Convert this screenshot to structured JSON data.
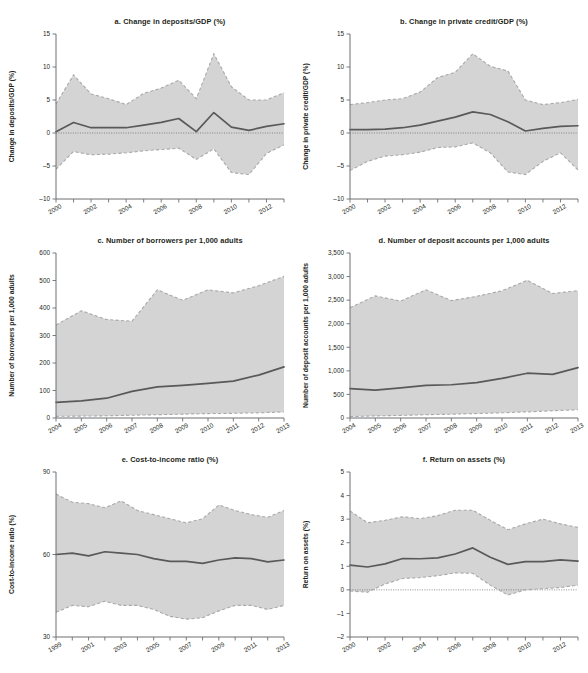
{
  "figure": {
    "panel_count": 6,
    "accent_band_color": "#d4d4d4",
    "line_color": "#58595b",
    "edge_color": "#a7a9ac",
    "axis_color": "#6d6e71"
  },
  "chart_data": [
    {
      "id": "a",
      "type": "line",
      "title": "a. Change in deposits/GDP (%)",
      "xlabel": "",
      "ylabel": "Change in deposits/GDP (%)",
      "xlim": [
        2000,
        2013
      ],
      "ylim": [
        -10,
        15
      ],
      "ytick_values": [
        -10,
        -5,
        0,
        5,
        10,
        15
      ],
      "ytick_labels": [
        "–10",
        "–5",
        "0",
        "5",
        "10",
        "15"
      ],
      "xtick_values": [
        2000,
        2001,
        2002,
        2003,
        2004,
        2005,
        2006,
        2007,
        2008,
        2009,
        2010,
        2011,
        2012,
        2013
      ],
      "xtick_labels": [
        "2000",
        "",
        "2002",
        "",
        "2004",
        "",
        "2006",
        "",
        "2008",
        "",
        "2010",
        "",
        "2012",
        ""
      ],
      "grid": false,
      "legend": "none",
      "zero_reference_line": 0,
      "x": [
        2000,
        2001,
        2002,
        2003,
        2004,
        2005,
        2006,
        2007,
        2008,
        2009,
        2010,
        2011,
        2012,
        2013
      ],
      "series": [
        {
          "name": "mean",
          "values": [
            0.2,
            1.6,
            0.8,
            0.8,
            0.8,
            1.2,
            1.6,
            2.2,
            0.2,
            3.1,
            0.9,
            0.4,
            1.0,
            1.4
          ]
        },
        {
          "name": "upper_bound",
          "values": [
            4.4,
            8.8,
            5.9,
            5.2,
            4.3,
            6.0,
            6.8,
            8.0,
            5.2,
            12.0,
            7.0,
            5.0,
            5.0,
            6.1
          ]
        },
        {
          "name": "lower_bound",
          "values": [
            -5.5,
            -2.8,
            -3.3,
            -3.2,
            -3.0,
            -2.7,
            -2.5,
            -2.3,
            -4.0,
            -2.4,
            -6.0,
            -6.3,
            -3.1,
            -1.8
          ]
        }
      ]
    },
    {
      "id": "b",
      "type": "line",
      "title": "b. Change in private credit/GDP (%)",
      "xlabel": "",
      "ylabel": "Change in private credit/GDP (%)",
      "xlim": [
        2000,
        2013
      ],
      "ylim": [
        -10,
        15
      ],
      "ytick_values": [
        -10,
        -5,
        0,
        5,
        10,
        15
      ],
      "ytick_labels": [
        "–10",
        "–5",
        "0",
        "5",
        "10",
        "15"
      ],
      "xtick_values": [
        2000,
        2001,
        2002,
        2003,
        2004,
        2005,
        2006,
        2007,
        2008,
        2009,
        2010,
        2011,
        2012,
        2013
      ],
      "xtick_labels": [
        "2000",
        "",
        "2002",
        "",
        "2004",
        "",
        "2006",
        "",
        "2008",
        "",
        "2010",
        "",
        "2012",
        ""
      ],
      "grid": false,
      "legend": "none",
      "zero_reference_line": 0,
      "x": [
        2000,
        2001,
        2002,
        2003,
        2004,
        2005,
        2006,
        2007,
        2008,
        2009,
        2010,
        2011,
        2012,
        2013
      ],
      "series": [
        {
          "name": "mean",
          "values": [
            0.5,
            0.5,
            0.6,
            0.8,
            1.2,
            1.8,
            2.4,
            3.2,
            2.8,
            1.7,
            0.3,
            0.7,
            1.0,
            1.1
          ]
        },
        {
          "name": "upper_bound",
          "values": [
            4.3,
            4.6,
            5.0,
            5.2,
            6.2,
            8.4,
            9.2,
            12.0,
            10.1,
            9.4,
            5.0,
            4.3,
            4.6,
            5.1
          ]
        },
        {
          "name": "lower_bound",
          "values": [
            -5.7,
            -4.3,
            -3.5,
            -3.3,
            -2.9,
            -2.2,
            -2.1,
            -1.5,
            -3.0,
            -5.9,
            -6.3,
            -4.3,
            -3.0,
            -5.6
          ]
        }
      ]
    },
    {
      "id": "c",
      "type": "line",
      "title": "c. Number of borrowers per 1,000 adults",
      "xlabel": "",
      "ylabel": "Number of borrowers per 1,000 adults",
      "xlim": [
        2004,
        2013
      ],
      "ylim": [
        0,
        600
      ],
      "ytick_values": [
        0,
        100,
        200,
        300,
        400,
        500,
        600
      ],
      "ytick_labels": [
        "0",
        "100",
        "200",
        "300",
        "400",
        "500",
        "600"
      ],
      "xtick_values": [
        2004,
        2005,
        2006,
        2007,
        2008,
        2009,
        2010,
        2011,
        2012,
        2013
      ],
      "xtick_labels": [
        "2004",
        "2005",
        "2006",
        "2007",
        "2008",
        "2009",
        "2010",
        "2011",
        "2012",
        "2013"
      ],
      "grid": false,
      "legend": "none",
      "x": [
        2004,
        2005,
        2006,
        2007,
        2008,
        2009,
        2010,
        2011,
        2012,
        2013
      ],
      "series": [
        {
          "name": "mean",
          "values": [
            57,
            62,
            72,
            97,
            113,
            119,
            126,
            134,
            156,
            186
          ]
        },
        {
          "name": "upper_bound",
          "values": [
            338,
            390,
            358,
            352,
            466,
            428,
            466,
            455,
            481,
            515
          ]
        },
        {
          "name": "lower_bound",
          "values": [
            6,
            7,
            8,
            10,
            12,
            14,
            16,
            17,
            19,
            22
          ]
        }
      ]
    },
    {
      "id": "d",
      "type": "line",
      "title": "d. Number of deposit accounts per 1,000 adults",
      "xlabel": "",
      "ylabel": "Number of deposit accounts per 1,000 adults",
      "xlim": [
        2004,
        2013
      ],
      "ylim": [
        0,
        3500
      ],
      "ytick_values": [
        0,
        500,
        1000,
        1500,
        2000,
        2500,
        3000,
        3500
      ],
      "ytick_labels": [
        "0",
        "500",
        "1,000",
        "1,500",
        "2,000",
        "2,500",
        "3,000",
        "3,500"
      ],
      "xtick_values": [
        2004,
        2005,
        2006,
        2007,
        2008,
        2009,
        2010,
        2011,
        2012,
        2013
      ],
      "xtick_labels": [
        "2004",
        "2005",
        "2006",
        "2007",
        "2008",
        "2009",
        "2010",
        "2011",
        "2012",
        "2013"
      ],
      "grid": false,
      "legend": "none",
      "x": [
        2004,
        2005,
        2006,
        2007,
        2008,
        2009,
        2010,
        2011,
        2012,
        2013
      ],
      "series": [
        {
          "name": "mean",
          "values": [
            625,
            590,
            640,
            690,
            705,
            750,
            840,
            950,
            925,
            1070
          ]
        },
        {
          "name": "upper_bound",
          "values": [
            2340,
            2590,
            2480,
            2720,
            2490,
            2580,
            2700,
            2920,
            2640,
            2700
          ]
        },
        {
          "name": "lower_bound",
          "values": [
            30,
            45,
            55,
            70,
            80,
            95,
            110,
            130,
            155,
            175
          ]
        }
      ]
    },
    {
      "id": "e",
      "type": "line",
      "title": "e. Cost-to-income ratio (%)",
      "xlabel": "",
      "ylabel": "Cost-to-income ratio (%)",
      "xlim": [
        1999,
        2013
      ],
      "ylim": [
        30,
        90
      ],
      "ytick_values": [
        30,
        60,
        90
      ],
      "ytick_labels": [
        "30",
        "60",
        "90"
      ],
      "xtick_values": [
        1999,
        2000,
        2001,
        2002,
        2003,
        2004,
        2005,
        2006,
        2007,
        2008,
        2009,
        2010,
        2011,
        2012,
        2013
      ],
      "xtick_labels": [
        "1999",
        "",
        "2001",
        "",
        "2003",
        "",
        "2005",
        "",
        "2007",
        "",
        "2009",
        "",
        "2011",
        "",
        "2013"
      ],
      "grid": false,
      "legend": "none",
      "x": [
        1999,
        2000,
        2001,
        2002,
        2003,
        2004,
        2005,
        2006,
        2007,
        2008,
        2009,
        2010,
        2011,
        2012,
        2013
      ],
      "series": [
        {
          "name": "mean",
          "values": [
            60.0,
            60.5,
            59.5,
            61.0,
            60.5,
            60.0,
            58.5,
            57.5,
            57.5,
            56.8,
            58.0,
            58.8,
            58.5,
            57.3,
            58.0
          ]
        },
        {
          "name": "upper_bound",
          "values": [
            82.0,
            79.0,
            78.5,
            77.0,
            79.5,
            76.0,
            74.5,
            73.0,
            71.5,
            73.0,
            78.0,
            76.0,
            74.5,
            73.5,
            76.0
          ]
        },
        {
          "name": "lower_bound",
          "values": [
            39.0,
            41.5,
            41.0,
            43.0,
            41.5,
            41.5,
            40.0,
            37.5,
            36.5,
            37.0,
            39.5,
            41.5,
            41.5,
            40.0,
            41.5
          ]
        }
      ]
    },
    {
      "id": "f",
      "type": "line",
      "title": "f. Return on assets (%)",
      "xlabel": "",
      "ylabel": "Return on assets (%)",
      "xlim": [
        2000,
        2013
      ],
      "ylim": [
        -2,
        5
      ],
      "ytick_values": [
        -2,
        -1,
        0,
        1,
        2,
        3,
        4,
        5
      ],
      "ytick_labels": [
        "–2",
        "–1",
        "0",
        "1",
        "2",
        "3",
        "4",
        "5"
      ],
      "xtick_values": [
        2000,
        2001,
        2002,
        2003,
        2004,
        2005,
        2006,
        2007,
        2008,
        2009,
        2010,
        2011,
        2012,
        2013
      ],
      "xtick_labels": [
        "2000",
        "",
        "2002",
        "",
        "2004",
        "",
        "2006",
        "",
        "2008",
        "",
        "2010",
        "",
        "2012",
        ""
      ],
      "grid": false,
      "legend": "none",
      "zero_reference_line": 0,
      "x": [
        2000,
        2001,
        2002,
        2003,
        2004,
        2005,
        2006,
        2007,
        2008,
        2009,
        2010,
        2011,
        2012,
        2013
      ],
      "series": [
        {
          "name": "mean",
          "values": [
            1.05,
            0.97,
            1.1,
            1.33,
            1.32,
            1.36,
            1.52,
            1.78,
            1.38,
            1.08,
            1.2,
            1.2,
            1.27,
            1.22
          ]
        },
        {
          "name": "upper_bound",
          "values": [
            3.35,
            2.85,
            2.95,
            3.1,
            3.02,
            3.15,
            3.38,
            3.38,
            2.95,
            2.55,
            2.8,
            3.0,
            2.8,
            2.65
          ]
        },
        {
          "name": "lower_bound",
          "values": [
            -0.05,
            -0.1,
            0.25,
            0.48,
            0.52,
            0.6,
            0.72,
            0.7,
            0.2,
            -0.22,
            0.0,
            0.05,
            0.1,
            0.2
          ]
        }
      ]
    }
  ]
}
